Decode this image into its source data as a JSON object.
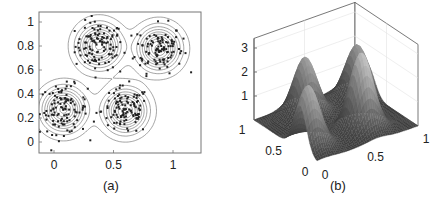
{
  "chart_data": [
    {
      "type": "scatter",
      "subtype": "scatter-with-contour",
      "caption": "(a)",
      "title": "",
      "xlabel": "",
      "ylabel": "",
      "xlim": [
        -0.13,
        1.23
      ],
      "ylim": [
        -0.1,
        1.08
      ],
      "xticks": [
        0,
        0.5,
        1
      ],
      "xtick_labels": [
        "0",
        "0.5",
        "1"
      ],
      "yticks": [
        0,
        0.2,
        0.4,
        0.6,
        0.8,
        1
      ],
      "ytick_labels": [
        "0",
        "0.2",
        "0.4",
        "0.6",
        "0.8",
        "1"
      ],
      "grid": false,
      "clusters": [
        {
          "center": [
            0.38,
            0.8
          ],
          "spread": 0.1,
          "n_points": 110
        },
        {
          "center": [
            0.88,
            0.78
          ],
          "spread": 0.1,
          "n_points": 110
        },
        {
          "center": [
            0.08,
            0.27
          ],
          "spread": 0.1,
          "n_points": 110
        },
        {
          "center": [
            0.6,
            0.26
          ],
          "spread": 0.1,
          "n_points": 110
        }
      ],
      "contour_levels": 10,
      "marker_color": "#222222",
      "contour_color": "#666666"
    },
    {
      "type": "surface",
      "caption": "(b)",
      "title": "",
      "xlim": [
        0,
        1
      ],
      "ylim": [
        0,
        1
      ],
      "zlim": [
        0,
        3.4
      ],
      "xticks": [
        0,
        0.5,
        1
      ],
      "xtick_labels": [
        "0",
        "0.5",
        "1"
      ],
      "yticks": [
        0,
        0.5,
        1
      ],
      "ytick_labels": [
        "0",
        "0.5",
        "1"
      ],
      "zticks": [
        1,
        2,
        3
      ],
      "ztick_labels": [
        "1",
        "2",
        "3"
      ],
      "peaks": [
        {
          "center": [
            0.38,
            0.8
          ],
          "height": 2.4
        },
        {
          "center": [
            0.88,
            0.78
          ],
          "height": 2.2
        },
        {
          "center": [
            0.08,
            0.27
          ],
          "height": 2.6
        },
        {
          "center": [
            0.6,
            0.26
          ],
          "height": 3.2
        }
      ],
      "colormap": "gray"
    }
  ]
}
